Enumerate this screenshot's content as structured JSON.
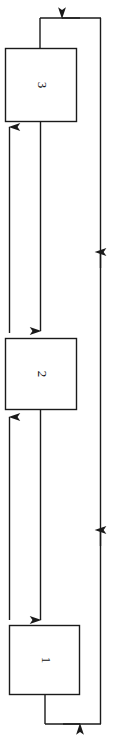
{
  "diagram": {
    "type": "cycle-flowchart",
    "orientation": "rotated-90-ccw",
    "background_color": "#ffffff",
    "stroke_color": "#1a1a1a",
    "nodes": [
      {
        "id": "node-3",
        "label": "3",
        "shape": "rectangle",
        "x": 5,
        "y": 48,
        "width": 72,
        "height": 74
      },
      {
        "id": "node-2",
        "label": "2",
        "shape": "rectangle",
        "x": 5,
        "y": 338,
        "width": 72,
        "height": 72
      },
      {
        "id": "node-1",
        "label": "1",
        "shape": "rectangle",
        "x": 9,
        "y": 625,
        "width": 71,
        "height": 70
      }
    ],
    "edges": [
      {
        "id": "edge-3-to-2",
        "from": "3",
        "to": "2",
        "arrowhead": "down"
      },
      {
        "id": "edge-2-to-1",
        "from": "2",
        "to": "1",
        "arrowhead": "down"
      },
      {
        "id": "edge-2-to-3",
        "from": "2",
        "to": "3",
        "arrowhead": "up"
      },
      {
        "id": "edge-1-to-2",
        "from": "1",
        "to": "2",
        "arrowhead": "up"
      },
      {
        "id": "edge-1-to-3-feedback",
        "from": "1",
        "to": "3",
        "arrowhead": "left",
        "routing": "right-side-loop"
      }
    ]
  }
}
